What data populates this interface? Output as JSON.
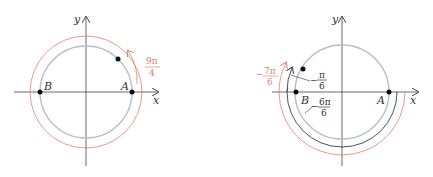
{
  "diagram_left": {
    "axis_x_label": "x",
    "axis_y_label": "y",
    "point_a_label": "A",
    "point_b_label": "B",
    "angle_label_num": "9π",
    "angle_label_den": "4",
    "colors": {
      "circle": "#b8bfc6",
      "arc": "#e0826a",
      "axis": "#333333"
    }
  },
  "diagram_right": {
    "axis_x_label": "x",
    "axis_y_label": "y",
    "point_a_label": "A",
    "point_b_label": "B",
    "label_neg7pi6_num": "7π",
    "label_neg7pi6_den": "6",
    "label_negpi6_num": "π",
    "label_negpi6_den": "6",
    "label_neg6pi6_num": "6π",
    "label_neg6pi6_den": "6",
    "minus_sign": "−",
    "colors": {
      "circle": "#b8bfc6",
      "dark_arc": "#2f3e55",
      "red_arc": "#e0826a",
      "axis": "#333333"
    }
  }
}
